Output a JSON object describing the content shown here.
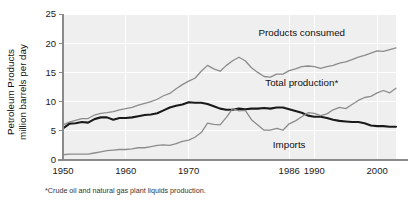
{
  "figure": {
    "footnote": "*Crude oil and natural gas plant liquids production."
  },
  "chart_data": {
    "type": "line",
    "title": "",
    "xlabel": "",
    "ylabel": "Petroleum Products million barrels per day",
    "ylabel_line1": "Petroleum Products",
    "ylabel_line2": "million barrels per day",
    "xlim": [
      1950,
      2003
    ],
    "ylim": [
      0,
      25
    ],
    "grid": true,
    "legend_position": "inline-annotations",
    "yticks": [
      0,
      5,
      10,
      15,
      20,
      25
    ],
    "ytick_labels": [
      "0",
      "5",
      "10",
      "15",
      "20",
      "25"
    ],
    "xticks": [
      1950,
      1960,
      1970,
      1986,
      1990,
      2000
    ],
    "xtick_labels": [
      "1950",
      "1960",
      "1970",
      "1986",
      "1990",
      "2000"
    ],
    "annotations": [
      {
        "text": "Products consumed",
        "x": 1988,
        "y": 21.3
      },
      {
        "text": "Total production*",
        "x": 1988,
        "y": 12.6
      },
      {
        "text": "Imports",
        "x": 1986,
        "y": 2.0
      }
    ],
    "colors": {
      "products_consumed": "#8c8c8c",
      "total_production": "#1a1a1a",
      "imports": "#8c8c8c",
      "plot_background": "#efefef",
      "gridline": "#ffffff",
      "axis": "#8a8a8a"
    },
    "x": [
      1950,
      1951,
      1952,
      1953,
      1954,
      1955,
      1956,
      1957,
      1958,
      1959,
      1960,
      1961,
      1962,
      1963,
      1964,
      1965,
      1966,
      1967,
      1968,
      1969,
      1970,
      1971,
      1972,
      1973,
      1974,
      1975,
      1976,
      1977,
      1978,
      1979,
      1980,
      1981,
      1982,
      1983,
      1984,
      1985,
      1986,
      1987,
      1988,
      1989,
      1990,
      1991,
      1992,
      1993,
      1994,
      1995,
      1996,
      1997,
      1998,
      1999,
      2000,
      2001,
      2002,
      2003
    ],
    "series": [
      {
        "name": "Products consumed",
        "width": 1.3,
        "color": "#8c8c8c",
        "values": [
          6.0,
          6.5,
          6.8,
          7.1,
          7.1,
          7.7,
          8.0,
          8.1,
          8.3,
          8.6,
          8.8,
          9.0,
          9.4,
          9.7,
          10.0,
          10.4,
          11.0,
          11.4,
          12.2,
          12.9,
          13.5,
          14.0,
          15.2,
          16.2,
          15.6,
          15.2,
          16.2,
          17.0,
          17.6,
          17.0,
          15.8,
          15.0,
          14.3,
          14.2,
          14.7,
          14.7,
          15.3,
          15.6,
          16.0,
          16.1,
          16.0,
          15.7,
          16.0,
          16.2,
          16.6,
          16.8,
          17.2,
          17.6,
          17.9,
          18.3,
          18.7,
          18.6,
          18.9,
          19.2
        ]
      },
      {
        "name": "Total production*",
        "width": 2.1,
        "color": "#1a1a1a",
        "values": [
          5.4,
          6.2,
          6.3,
          6.5,
          6.4,
          7.0,
          7.3,
          7.3,
          6.9,
          7.2,
          7.2,
          7.3,
          7.5,
          7.7,
          7.8,
          8.0,
          8.5,
          9.0,
          9.3,
          9.5,
          9.9,
          9.8,
          9.8,
          9.6,
          9.2,
          8.8,
          8.6,
          8.6,
          8.8,
          8.7,
          8.8,
          8.8,
          8.9,
          8.8,
          9.0,
          9.0,
          8.7,
          8.4,
          8.1,
          7.6,
          7.4,
          7.4,
          7.2,
          6.9,
          6.7,
          6.6,
          6.5,
          6.5,
          6.3,
          5.9,
          5.8,
          5.8,
          5.7,
          5.7
        ]
      },
      {
        "name": "Imports",
        "width": 1.3,
        "color": "#8c8c8c",
        "values": [
          0.9,
          1.0,
          1.0,
          1.0,
          1.0,
          1.2,
          1.4,
          1.6,
          1.7,
          1.8,
          1.8,
          1.9,
          2.1,
          2.1,
          2.3,
          2.5,
          2.6,
          2.5,
          2.8,
          3.2,
          3.4,
          3.9,
          4.7,
          6.3,
          6.1,
          6.0,
          7.3,
          8.8,
          8.4,
          8.5,
          6.9,
          6.0,
          5.1,
          5.1,
          5.4,
          5.1,
          6.2,
          6.7,
          7.4,
          8.1,
          8.0,
          7.6,
          7.9,
          8.6,
          9.0,
          8.8,
          9.5,
          10.2,
          10.7,
          10.9,
          11.5,
          11.9,
          11.5,
          12.3
        ]
      }
    ]
  }
}
